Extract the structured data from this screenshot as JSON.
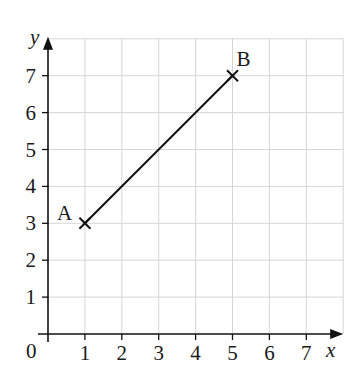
{
  "chart_data": {
    "type": "line",
    "title": "",
    "xlabel": "x",
    "ylabel": "y",
    "xlim": [
      0,
      7.5
    ],
    "ylim": [
      0,
      7.5
    ],
    "grid": true,
    "origin_label": "0",
    "x_ticks": [
      "1",
      "2",
      "3",
      "4",
      "5",
      "6",
      "7"
    ],
    "y_ticks": [
      "1",
      "2",
      "3",
      "4",
      "5",
      "6",
      "7"
    ],
    "series": [
      {
        "name": "AB",
        "points": [
          {
            "label": "A",
            "x": 1,
            "y": 3
          },
          {
            "label": "B",
            "x": 5,
            "y": 7
          }
        ]
      }
    ]
  }
}
